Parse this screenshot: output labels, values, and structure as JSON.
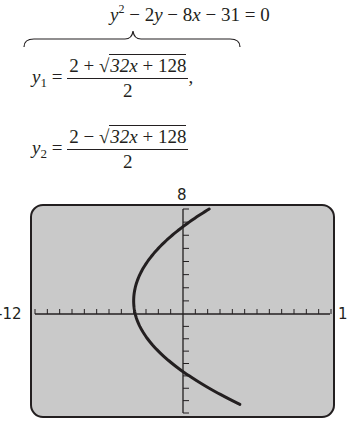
{
  "equation": {
    "general_form": "y² − 2y − 8x − 31 = 0",
    "y1_label": "y₁ =",
    "y1_numerator": "2 + √(32x + 128)",
    "y1_numerator_prefix": "2 + ",
    "radicand": "32x + 128",
    "y1_denominator": "2",
    "y1_trailing": ",",
    "y2_label": "y₂ =",
    "y2_numerator_prefix": "2 − ",
    "y2_denominator": "2"
  },
  "chart_data": {
    "type": "line",
    "title": "",
    "xlabel": "",
    "ylabel": "",
    "xlim": [
      -12,
      12
    ],
    "ylim": [
      -8,
      8
    ],
    "x_tick_spacing": 1,
    "y_tick_spacing": 1,
    "grid": false,
    "window_labels": {
      "top": "8",
      "left": "-12",
      "right": "1"
    },
    "series": [
      {
        "name": "y² − 2y − 8x − 31 = 0 (parabola opening right)",
        "vertex": [
          -4,
          1
        ],
        "x": [
          2.125,
          0.875,
          -0.25,
          -1.25,
          -2.125,
          -2.875,
          -3.5,
          -4.0,
          -4.375,
          -4.625,
          -4.75,
          -4.625,
          -4.375,
          -4.0,
          -3.5,
          -2.875,
          -2.125,
          -1.25,
          -0.25,
          0.875,
          2.125,
          3.5,
          5.0,
          6.125
        ],
        "y": [
          8,
          7.5,
          7,
          6.5,
          6,
          5.5,
          5,
          4.46,
          3.8,
          3,
          1,
          -1,
          -1.8,
          -2.46,
          -3,
          -3.5,
          -4,
          -4.5,
          -5,
          -5.5,
          -6,
          -6.5,
          -7,
          -7.3
        ]
      }
    ],
    "series_functions": [
      {
        "name": "y1",
        "formula": "(2 + sqrt(32x + 128)) / 2"
      },
      {
        "name": "y2",
        "formula": "(2 - sqrt(32x + 128)) / 2"
      }
    ]
  },
  "colors": {
    "screen_bg": "#c9c9c9",
    "ink": "#231f20"
  }
}
